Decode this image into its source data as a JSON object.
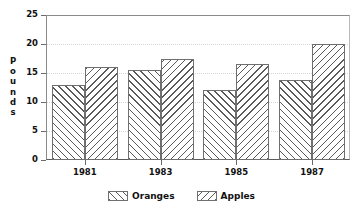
{
  "chart_data": {
    "type": "bar",
    "title": "",
    "xlabel": "",
    "ylabel": "Pounds",
    "categories": [
      "1981",
      "1983",
      "1985",
      "1987"
    ],
    "series": [
      {
        "name": "Oranges",
        "hatch": "up",
        "values": [
          13,
          15.5,
          12,
          13.8
        ]
      },
      {
        "name": "Apples",
        "hatch": "down",
        "values": [
          16,
          17.5,
          16.5,
          20
        ]
      }
    ],
    "ylim": [
      0,
      25
    ],
    "y_ticks": [
      0,
      5,
      10,
      15,
      20,
      25
    ],
    "y_tick_labels": [
      "0",
      "5",
      "10",
      "15",
      "20",
      "25"
    ],
    "grid": true,
    "legend_position": "bottom"
  },
  "axis": {
    "y_title_letters": [
      "P",
      "o",
      "u",
      "n",
      "d",
      "s"
    ]
  },
  "colors": {
    "hatch": "#5a5a5a",
    "frame": "#6a6a6a",
    "grid": "#d6d6d6",
    "background": "#ffffff"
  }
}
